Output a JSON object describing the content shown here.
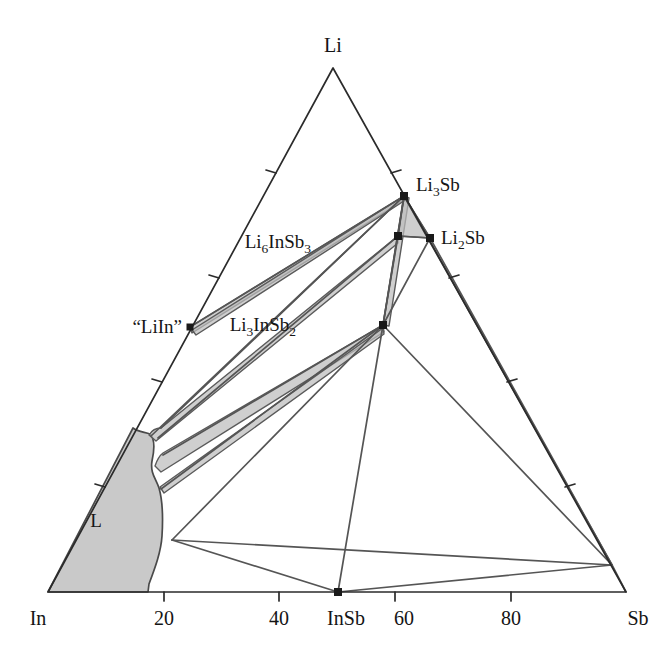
{
  "figure": {
    "type": "ternary-phase-diagram",
    "system": "Li-In-Sb",
    "background_color": "#ffffff",
    "line_color": "#3a3a3a",
    "shade_color": "#c9c9c9"
  },
  "corners": {
    "left": {
      "label": "In",
      "x": 48,
      "y": 592
    },
    "right": {
      "label": "Sb",
      "x": 626,
      "y": 592
    },
    "top": {
      "label": "Li",
      "x": 333,
      "y": 68
    }
  },
  "bottom_axis": {
    "ticks": [
      {
        "label": "20",
        "value": 20,
        "x": 164,
        "y": 592
      },
      {
        "label": "40",
        "value": 40,
        "x": 279,
        "y": 592
      },
      {
        "label": "InSb",
        "value": 50,
        "x": 338,
        "y": 592
      },
      {
        "label": "60",
        "value": 60,
        "x": 395,
        "y": 592
      },
      {
        "label": "80",
        "value": 80,
        "x": 511,
        "y": 592
      }
    ]
  },
  "edge_ticks": {
    "left_edge_count": 4,
    "right_edge_count": 4,
    "bottom_edge_count": 5,
    "interval_percent": 20
  },
  "phase_points": [
    {
      "name": "Li3Sb",
      "label_main": "Li",
      "label_sub1": "3",
      "label_tail": "Sb",
      "x": 404,
      "y": 196,
      "label_x": 416,
      "label_y": 191
    },
    {
      "name": "Li2Sb",
      "label_main": "Li",
      "label_sub1": "2",
      "label_tail": "Sb",
      "x": 430,
      "y": 238,
      "label_x": 441,
      "label_y": 240
    },
    {
      "name": "Li6InSb3",
      "label_main": "Li",
      "label_sub1": "6",
      "label_mid": "InSb",
      "label_sub2": "3",
      "x": 398,
      "y": 236,
      "label_x": 311,
      "label_y": 248
    },
    {
      "name": "Li3InSb2",
      "label_main": "Li",
      "label_sub1": "3",
      "label_mid": "InSb",
      "label_sub2": "2",
      "x": 383,
      "y": 325,
      "label_x": 296,
      "label_y": 329
    },
    {
      "name": "LiIn",
      "label_main": "“LiIn”",
      "x": 190,
      "y": 327,
      "label_x": 130,
      "label_y": 331
    },
    {
      "name": "InSb",
      "label_main": "InSb",
      "x": 338,
      "y": 592,
      "label_x": 316,
      "label_y": 624
    }
  ],
  "regions": [
    {
      "name": "liquid",
      "label": "L",
      "label_x": 96,
      "label_y": 521,
      "fill": "#c9c9c9"
    }
  ],
  "tie_lines_note": "single-phase compound points joined by two-phase tie lines; narrow shaded slivers are two-phase fields"
}
